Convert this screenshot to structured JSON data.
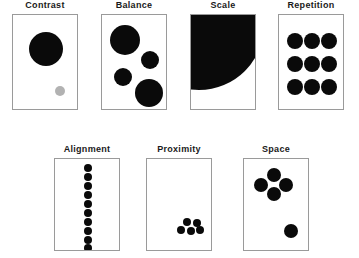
{
  "diagram": {
    "background_color": "#ffffff",
    "shape_color": "#0a0a0a",
    "accent_gray": "#b2b2b2",
    "frame_border_color": "#9a9a9a"
  },
  "panels": [
    {
      "id": "contrast",
      "label": "Contrast",
      "row": 1,
      "frame": {
        "x": 12,
        "y": 14,
        "w": 66,
        "h": 96
      },
      "description": "One large black circle and one small light gray circle",
      "shapes": [
        {
          "type": "circle",
          "cx": 33,
          "cy": 34,
          "r": 17,
          "color": "#0a0a0a"
        },
        {
          "type": "circle",
          "cx": 47,
          "cy": 76,
          "r": 5,
          "color": "#b2b2b2"
        }
      ]
    },
    {
      "id": "balance",
      "label": "Balance",
      "row": 1,
      "frame": {
        "x": 101,
        "y": 14,
        "w": 66,
        "h": 96
      },
      "description": "Four circles of varied sizes distributed for visual equilibrium",
      "shapes": [
        {
          "type": "circle",
          "cx": 23,
          "cy": 25,
          "r": 15,
          "color": "#0a0a0a"
        },
        {
          "type": "circle",
          "cx": 48,
          "cy": 45,
          "r": 9,
          "color": "#0a0a0a"
        },
        {
          "type": "circle",
          "cx": 21,
          "cy": 62,
          "r": 9,
          "color": "#0a0a0a"
        },
        {
          "type": "circle",
          "cx": 47,
          "cy": 78,
          "r": 14,
          "color": "#0a0a0a"
        }
      ]
    },
    {
      "id": "scale",
      "label": "Scale",
      "row": 1,
      "frame": {
        "x": 190,
        "y": 14,
        "w": 66,
        "h": 96
      },
      "description": "A single oversized circle cropped by the frame edges",
      "shapes": [
        {
          "type": "circle",
          "cx": 8,
          "cy": 10,
          "r": 65,
          "color": "#0a0a0a"
        }
      ]
    },
    {
      "id": "repetition",
      "label": "Repetition",
      "row": 1,
      "frame": {
        "x": 278,
        "y": 14,
        "w": 66,
        "h": 96
      },
      "description": "Nine identical circles in a three by three grid",
      "shapes": [
        {
          "type": "circle",
          "cx": 16,
          "cy": 26,
          "r": 8,
          "color": "#0a0a0a"
        },
        {
          "type": "circle",
          "cx": 33,
          "cy": 26,
          "r": 8,
          "color": "#0a0a0a"
        },
        {
          "type": "circle",
          "cx": 50,
          "cy": 26,
          "r": 8,
          "color": "#0a0a0a"
        },
        {
          "type": "circle",
          "cx": 16,
          "cy": 49,
          "r": 8,
          "color": "#0a0a0a"
        },
        {
          "type": "circle",
          "cx": 33,
          "cy": 49,
          "r": 8,
          "color": "#0a0a0a"
        },
        {
          "type": "circle",
          "cx": 50,
          "cy": 49,
          "r": 8,
          "color": "#0a0a0a"
        },
        {
          "type": "circle",
          "cx": 16,
          "cy": 72,
          "r": 8,
          "color": "#0a0a0a"
        },
        {
          "type": "circle",
          "cx": 33,
          "cy": 72,
          "r": 8,
          "color": "#0a0a0a"
        },
        {
          "type": "circle",
          "cx": 50,
          "cy": 72,
          "r": 8,
          "color": "#0a0a0a"
        }
      ]
    },
    {
      "id": "alignment",
      "label": "Alignment",
      "row": 2,
      "frame": {
        "x": 54,
        "y": 158,
        "w": 66,
        "h": 93
      },
      "description": "Ten small circles stacked in one straight vertical column",
      "shapes": [
        {
          "type": "circle",
          "cx": 33,
          "cy": 9,
          "r": 4,
          "color": "#0a0a0a"
        },
        {
          "type": "circle",
          "cx": 33,
          "cy": 18,
          "r": 4,
          "color": "#0a0a0a"
        },
        {
          "type": "circle",
          "cx": 33,
          "cy": 27,
          "r": 4,
          "color": "#0a0a0a"
        },
        {
          "type": "circle",
          "cx": 33,
          "cy": 36,
          "r": 4,
          "color": "#0a0a0a"
        },
        {
          "type": "circle",
          "cx": 33,
          "cy": 45,
          "r": 4,
          "color": "#0a0a0a"
        },
        {
          "type": "circle",
          "cx": 33,
          "cy": 54,
          "r": 4,
          "color": "#0a0a0a"
        },
        {
          "type": "circle",
          "cx": 33,
          "cy": 63,
          "r": 4,
          "color": "#0a0a0a"
        },
        {
          "type": "circle",
          "cx": 33,
          "cy": 72,
          "r": 4,
          "color": "#0a0a0a"
        },
        {
          "type": "circle",
          "cx": 33,
          "cy": 81,
          "r": 4,
          "color": "#0a0a0a"
        },
        {
          "type": "circle",
          "cx": 33,
          "cy": 89,
          "r": 4,
          "color": "#0a0a0a"
        }
      ]
    },
    {
      "id": "proximity",
      "label": "Proximity",
      "row": 2,
      "frame": {
        "x": 146,
        "y": 158,
        "w": 66,
        "h": 93
      },
      "description": "Five small circles grouped tightly in the lower right corner",
      "shapes": [
        {
          "type": "circle",
          "cx": 40,
          "cy": 63,
          "r": 4,
          "color": "#0a0a0a"
        },
        {
          "type": "circle",
          "cx": 50,
          "cy": 64,
          "r": 4,
          "color": "#0a0a0a"
        },
        {
          "type": "circle",
          "cx": 34,
          "cy": 71,
          "r": 4,
          "color": "#0a0a0a"
        },
        {
          "type": "circle",
          "cx": 44,
          "cy": 72,
          "r": 4,
          "color": "#0a0a0a"
        },
        {
          "type": "circle",
          "cx": 53,
          "cy": 71,
          "r": 4,
          "color": "#0a0a0a"
        }
      ]
    },
    {
      "id": "space",
      "label": "Space",
      "row": 2,
      "frame": {
        "x": 243,
        "y": 158,
        "w": 66,
        "h": 93
      },
      "description": "A cluster of four circles upper left with one isolated circle lower right",
      "shapes": [
        {
          "type": "circle",
          "cx": 30,
          "cy": 16,
          "r": 7,
          "color": "#0a0a0a"
        },
        {
          "type": "circle",
          "cx": 17,
          "cy": 26,
          "r": 7,
          "color": "#0a0a0a"
        },
        {
          "type": "circle",
          "cx": 42,
          "cy": 26,
          "r": 7,
          "color": "#0a0a0a"
        },
        {
          "type": "circle",
          "cx": 30,
          "cy": 35,
          "r": 7,
          "color": "#0a0a0a"
        },
        {
          "type": "circle",
          "cx": 47,
          "cy": 72,
          "r": 7,
          "color": "#0a0a0a"
        }
      ]
    }
  ]
}
